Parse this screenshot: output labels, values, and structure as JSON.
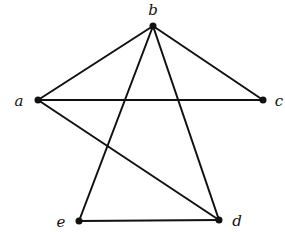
{
  "graph": {
    "vertices": [
      {
        "id": "a",
        "label": "a",
        "x": 38,
        "y": 100,
        "lx": 19,
        "ly": 106
      },
      {
        "id": "b",
        "label": "b",
        "x": 153,
        "y": 26,
        "lx": 153,
        "ly": 15
      },
      {
        "id": "c",
        "label": "c",
        "x": 263,
        "y": 100,
        "lx": 279,
        "ly": 106
      },
      {
        "id": "d",
        "label": "d",
        "x": 219,
        "y": 220,
        "lx": 237,
        "ly": 226
      },
      {
        "id": "e",
        "label": "e",
        "x": 79,
        "y": 221,
        "lx": 61,
        "ly": 227
      }
    ],
    "edges": [
      [
        "a",
        "b"
      ],
      [
        "b",
        "c"
      ],
      [
        "a",
        "c"
      ],
      [
        "b",
        "e"
      ],
      [
        "b",
        "d"
      ],
      [
        "a",
        "d"
      ],
      [
        "e",
        "d"
      ]
    ]
  }
}
